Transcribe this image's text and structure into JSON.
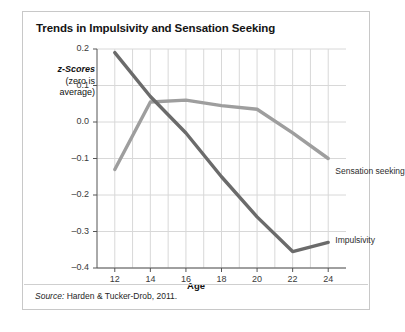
{
  "figure": {
    "title": "Trends in Impulsivity and Sensation Seeking",
    "source_label": "Source:",
    "source_text": "Harden & Tucker-Drob, 2011."
  },
  "chart_data": {
    "type": "line",
    "title": "Trends in Impulsivity and Sensation Seeking",
    "xlabel": "Age",
    "ylabel": "z-Scores (zero is average)",
    "ylabel_line1": "z-Scores",
    "ylabel_line2": "(zero is",
    "ylabel_line3": "average)",
    "xlim": [
      11,
      25
    ],
    "ylim": [
      -0.4,
      0.2
    ],
    "xticks": [
      12,
      14,
      16,
      18,
      20,
      22,
      24
    ],
    "xtick_labels": [
      "12",
      "14",
      "16",
      "18",
      "20",
      "22",
      "24"
    ],
    "yticks": [
      0.2,
      0.1,
      0.0,
      -0.1,
      -0.2,
      -0.3,
      -0.4
    ],
    "ytick_labels": [
      "0.2",
      "0.1",
      "0.0",
      "–0.1",
      "–0.2",
      "–0.3",
      "–0.4"
    ],
    "grid": true,
    "grid_x_step": 1,
    "grid_color": "#d8d8d8",
    "legend": "inline-labels",
    "x": [
      12,
      14,
      16,
      18,
      20,
      22,
      24
    ],
    "series": [
      {
        "name": "Impulsivity",
        "color": "#6b6b6b",
        "values": [
          0.19,
          0.07,
          -0.03,
          -0.15,
          -0.26,
          -0.355,
          -0.33
        ],
        "label_x": 24.4,
        "label_y": -0.325
      },
      {
        "name": "Sensation seeking",
        "color": "#9e9e9e",
        "values": [
          -0.13,
          0.055,
          0.06,
          0.045,
          0.035,
          -0.03,
          -0.1
        ],
        "label_x": 24.4,
        "label_y": -0.138
      }
    ]
  }
}
